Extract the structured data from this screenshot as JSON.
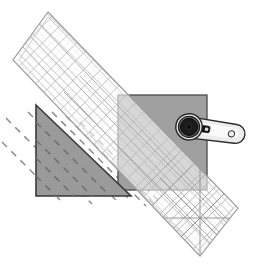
{
  "scene": {
    "title": "Quilting diagram: rotary cutter trimming fabric triangle against marked ruler",
    "width": 259,
    "height": 269,
    "background_color": "#ffffff"
  },
  "colors": {
    "background": "#ffffff",
    "fabric_triangle_fill": "#9a9a9a",
    "fabric_triangle_stroke": "#3a3a3a",
    "fabric_square_fill": "#a0a0a0",
    "fabric_square_stroke": "#4a4a4a",
    "fabric_square_under_ruler_fill": "#c4c4c4",
    "ruler_fill": "#ffffff",
    "ruler_fill_opacity": "0.55",
    "ruler_edge_stroke": "#9e9e9e",
    "ruler_grid_stroke": "#b4b4b4",
    "ruler_diagonal_stroke": "#a8a8a8",
    "seam_dash_stroke": "#8c8c8c",
    "cutter_blade_dark": "#1c1c1c",
    "cutter_blade_ring": "#6e6e6e",
    "cutter_hub": "#0d0d0d",
    "cutter_handle_fill": "#ececec",
    "cutter_handle_stroke": "#2a2a2a",
    "cutter_guard_fill": "#ffffff",
    "cutter_switch_fill": "#111111"
  },
  "objects": {
    "ruler": {
      "label": "quilting ruler",
      "corners": [
        [
          48,
          12
        ],
        [
          13,
          60
        ],
        [
          200,
          256
        ],
        [
          238,
          208
        ]
      ],
      "rotation_deg": 45,
      "grid_spacing_px": 12,
      "has_45_degree_guides": true
    },
    "fabric_square": {
      "label": "grey fabric square",
      "x": 118,
      "y": 95,
      "width": 89,
      "height": 95
    },
    "fabric_triangle": {
      "label": "grey fabric triangle",
      "points": [
        [
          36,
          105
        ],
        [
          36,
          196
        ],
        [
          131,
          196
        ]
      ]
    },
    "seam_guides": {
      "label": "dashed seam guide lines",
      "count": 7,
      "angle_deg": 45,
      "dash_pattern": "7 6"
    },
    "rotary_cutter": {
      "label": "rotary cutter",
      "blade_center": [
        190,
        127
      ],
      "blade_radius": 11,
      "handle_angle_deg": 8,
      "handle_length": 52,
      "has_hanging_hole": true
    }
  },
  "annotations": {
    "figure_caption": "",
    "notes": []
  }
}
